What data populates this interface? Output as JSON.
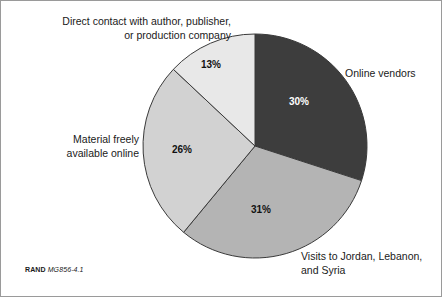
{
  "figure": {
    "background_color": "#ffffff",
    "border_color": "#9a9a9a"
  },
  "source_note": {
    "organization": "RAND",
    "identifier": "MG856-4.1"
  },
  "labels": {
    "direct_contact": "Direct contact with author, publisher,\nor production company",
    "online_vendors": "Online vendors",
    "visits": "Visits to Jordan, Lebanon,\nand Syria",
    "material_free": "Material freely\navailable online"
  },
  "percent_labels": {
    "online_vendors": "30%",
    "visits": "31%",
    "material_free": "26%",
    "direct_contact": "13%"
  },
  "chart_data": {
    "type": "pie",
    "title": "",
    "categories": [
      "Online vendors",
      "Visits to Jordan, Lebanon, and Syria",
      "Material freely available online",
      "Direct contact with author, publisher, or production company"
    ],
    "values": [
      30,
      31,
      26,
      13
    ],
    "value_labels": [
      "30%",
      "31%",
      "26%",
      "13%"
    ],
    "colors": [
      "#3d3d3d",
      "#b4b4b4",
      "#d2d2d2",
      "#e8e8e8"
    ],
    "label_text_colors": [
      "#ffffff",
      "#111111",
      "#111111",
      "#111111"
    ],
    "slice_border_color": "#3a3a3a",
    "start_angle_deg": 0,
    "direction": "clockwise",
    "legend": "none",
    "grid": false,
    "center": [
      254,
      145
    ],
    "radius": 112,
    "units": "percent"
  }
}
